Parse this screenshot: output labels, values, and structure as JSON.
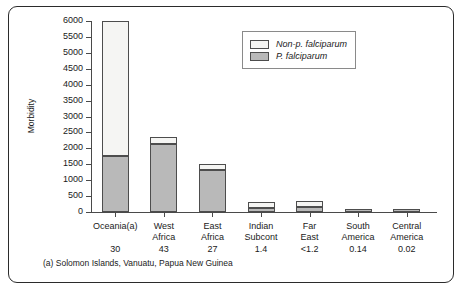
{
  "chart_data": {
    "type": "bar",
    "title": "",
    "subtitle": "",
    "xlabel": "",
    "ylabel": "Morbidity",
    "ylim": [
      0,
      6000
    ],
    "ytick_step": 500,
    "yticks": [
      0,
      500,
      1000,
      1500,
      2000,
      2500,
      3000,
      3500,
      4000,
      4500,
      5000,
      5500,
      6000
    ],
    "grid": false,
    "stacked": true,
    "legend_position": "top-right",
    "categories": [
      "Oceania(a)",
      "West\nAfrica",
      "East\nAfrica",
      "Indian\nSubcont",
      "Far\nEast",
      "South\nAmerica",
      "Central\nAmerica"
    ],
    "category_values": [
      "30",
      "43",
      "27",
      "1.4",
      "<1.2",
      "0.14",
      "0.02"
    ],
    "series": [
      {
        "name": "P. falciparum",
        "color": "#b9b9b9",
        "values": [
          1750,
          2150,
          1320,
          140,
          150,
          60,
          50
        ]
      },
      {
        "name": "Non-p. falciparum",
        "color": "#f5f5f3",
        "values": [
          4250,
          210,
          190,
          160,
          180,
          20,
          20
        ]
      }
    ],
    "totals": [
      6000,
      2360,
      1510,
      300,
      330,
      80,
      70
    ],
    "annotations": [
      "(a) Solomon Islands, Vanuatu, Papua New Guinea"
    ]
  },
  "axis": {
    "y_label": "Morbidity",
    "ytick_labels": [
      "6000",
      "5500",
      "5000",
      "4500",
      "4000",
      "3500",
      "3000",
      "2500",
      "2000",
      "1500",
      "1000",
      "500",
      "0"
    ]
  },
  "legend": {
    "items": [
      {
        "label": "Non-p. falciparum",
        "swatch": "non-pf-swatch"
      },
      {
        "label": "P. falciparum",
        "swatch": "pf-swatch"
      }
    ]
  },
  "footnote": {
    "text": "(a) Solomon Islands, Vanuatu, Papua New Guinea"
  }
}
